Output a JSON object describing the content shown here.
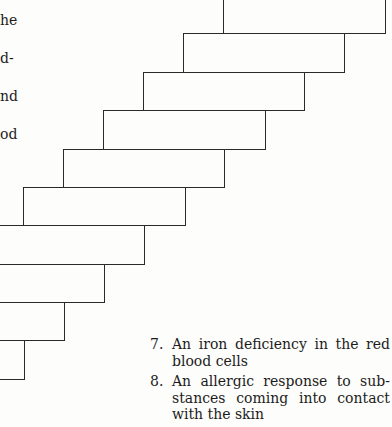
{
  "left_fragments": [
    {
      "text": "he",
      "top": 12
    },
    {
      "text": "d-",
      "top": 50
    },
    {
      "text": "nd",
      "top": 88
    },
    {
      "text": "od",
      "top": 126
    }
  ],
  "staircase": {
    "stroke_color": "#2a2a2a",
    "boxes": [
      {
        "left": 223,
        "top": -10,
        "width": 163,
        "height": 44
      },
      {
        "left": 183,
        "top": 33,
        "width": 162,
        "height": 40
      },
      {
        "left": 143,
        "top": 72,
        "width": 162,
        "height": 39
      },
      {
        "left": 103,
        "top": 110,
        "width": 163,
        "height": 40
      },
      {
        "left": 63,
        "top": 149,
        "width": 162,
        "height": 39
      },
      {
        "left": 23,
        "top": 187,
        "width": 163,
        "height": 39
      },
      {
        "left": -20,
        "top": 225,
        "width": 165,
        "height": 40
      },
      {
        "left": -60,
        "top": 264,
        "width": 165,
        "height": 39
      },
      {
        "left": -100,
        "top": 302,
        "width": 165,
        "height": 39
      },
      {
        "left": -140,
        "top": 340,
        "width": 165,
        "height": 40
      }
    ]
  },
  "list": {
    "items": [
      {
        "number": "7.",
        "text": "An iron deficiency in the red blood cells"
      },
      {
        "number": "8.",
        "text": "An allergic response to sub-stances coming into contact with the skin"
      }
    ]
  }
}
